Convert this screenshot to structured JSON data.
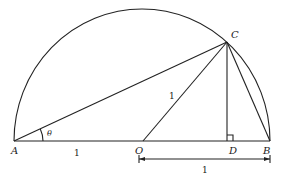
{
  "diagram": {
    "type": "geometry",
    "points": {
      "A": {
        "label": "A"
      },
      "O": {
        "label": "O"
      },
      "D": {
        "label": "D"
      },
      "B": {
        "label": "B"
      },
      "C": {
        "label": "C"
      }
    },
    "labels": {
      "angle": "θ",
      "AO_length": "1",
      "OC_length": "1",
      "OB_length": "1"
    },
    "segments": [
      "AB",
      "AC",
      "OC",
      "CD",
      "CB"
    ],
    "right_angle_at": "D",
    "colors": {
      "line": "#222222",
      "background": "#ffffff"
    }
  }
}
